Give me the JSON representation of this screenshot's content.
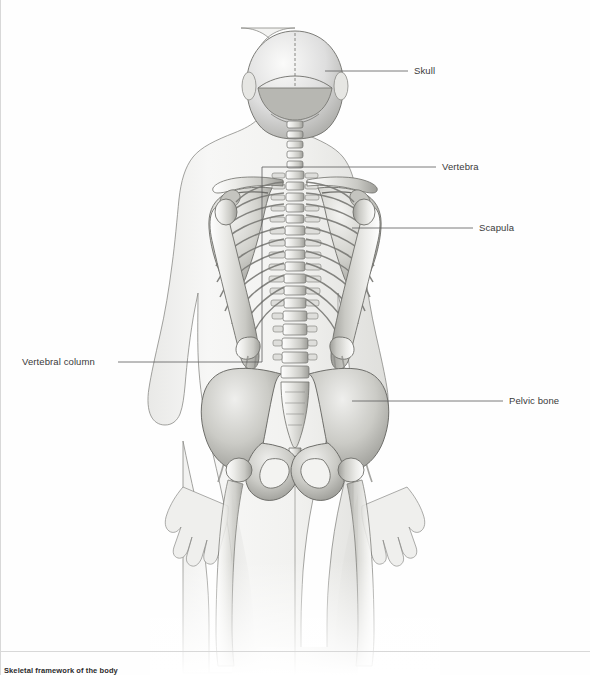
{
  "figure": {
    "title": "Skeletal framework of the body",
    "view": "posterior",
    "background_color": "#fefefe",
    "line_color": "#555555",
    "bone_fill": "#d9d9d6",
    "body_fill": "#f2f2f0",
    "text_color": "#3a3a3a"
  },
  "labels": [
    {
      "id": "skull",
      "text": "Skull",
      "x": 414,
      "y": 71,
      "align": "left",
      "leader": {
        "x1": 325,
        "y1": 71,
        "x2": 408,
        "y2": 71
      }
    },
    {
      "id": "vertebra",
      "text": "Vertebra",
      "x": 442,
      "y": 167,
      "align": "left",
      "leader": {
        "x1": 262,
        "y1": 167,
        "x2": 436,
        "y2": 167
      }
    },
    {
      "id": "scapula",
      "text": "Scapula",
      "x": 479,
      "y": 228,
      "align": "left",
      "leader": {
        "x1": 352,
        "y1": 228,
        "x2": 473,
        "y2": 228
      }
    },
    {
      "id": "vertebral-column",
      "text": "Vertebral column",
      "x": 22,
      "y": 362,
      "align": "right",
      "leader": {
        "x1": 118,
        "y1": 362,
        "x2": 262,
        "y2": 362
      }
    },
    {
      "id": "pelvic-bone",
      "text": "Pelvic bone",
      "x": 509,
      "y": 401,
      "align": "left",
      "leader": {
        "x1": 352,
        "y1": 401,
        "x2": 503,
        "y2": 401
      }
    }
  ],
  "structures": [
    "skull",
    "cervical vertebrae",
    "thoracic vertebrae",
    "lumbar vertebrae",
    "sacrum",
    "coccyx",
    "clavicle",
    "scapula",
    "humerus",
    "radius",
    "ulna",
    "ribs",
    "pelvic bone",
    "femur"
  ]
}
